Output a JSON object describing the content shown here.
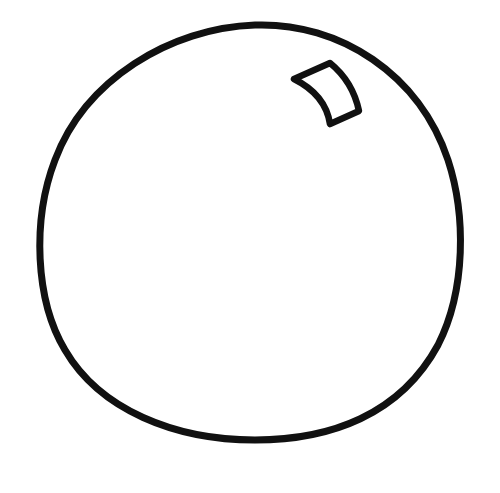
{
  "drawing": {
    "subject": "ball outline with highlight",
    "background_color": "#ffffff",
    "stroke_color": "#111111",
    "stroke_width": 7,
    "shapes": [
      {
        "name": "ball-outline",
        "type": "closed-curve",
        "center": [
          250,
          232
        ],
        "approx_radius_x": 212,
        "approx_radius_y": 208
      },
      {
        "name": "highlight",
        "type": "curved-quadrilateral",
        "position": [
          293,
          62
        ],
        "size": [
          70,
          62
        ]
      }
    ]
  }
}
